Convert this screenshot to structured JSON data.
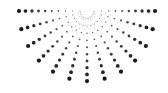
{
  "graphic": {
    "type": "dotted-sunburst-half",
    "dot_color": "#1a1a1a",
    "background": "#ffffff",
    "center": [
      87,
      11
    ],
    "ray_count": 13,
    "ray_start_deg": 0,
    "ray_end_deg": 180,
    "dots_per_ray": 10,
    "inner_radius": 7,
    "outer_radius": 68,
    "min_dot_radius": 0.5,
    "max_dot_radius": 2.1
  }
}
